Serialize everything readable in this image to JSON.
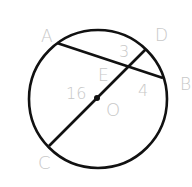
{
  "diagram": {
    "type": "circle-geometry",
    "circle": {
      "center_label": "O",
      "cx": 98,
      "cy": 99,
      "r": 69
    },
    "points": {
      "A": {
        "label": "A",
        "x": 57,
        "y": 43,
        "lx": 41,
        "ly": 42
      },
      "B": {
        "label": "B",
        "x": 163,
        "y": 78,
        "lx": 180,
        "ly": 90
      },
      "C": {
        "label": "C",
        "x": 49,
        "y": 146,
        "lx": 38,
        "ly": 169
      },
      "D": {
        "label": "D",
        "x": 146,
        "y": 49,
        "lx": 155,
        "ly": 41
      },
      "E": {
        "label": "E",
        "x": 128,
        "y": 67,
        "lx": 98,
        "ly": 81
      },
      "O": {
        "label": "O",
        "x": 97,
        "y": 98,
        "lx": 106,
        "ly": 116
      }
    },
    "segment_labels": {
      "DE": {
        "text": "3",
        "x": 119,
        "y": 57
      },
      "EB": {
        "text": "4",
        "x": 138,
        "y": 96
      },
      "OC_radius": {
        "text": "16",
        "x": 66,
        "y": 99
      }
    },
    "chords": [
      {
        "name": "AB",
        "from": "A",
        "to": "B"
      },
      {
        "name": "CD",
        "from": "C",
        "to": "D"
      }
    ],
    "colors": {
      "stroke": "#111111",
      "label": "#c8c8c8",
      "background": "#ffffff"
    }
  }
}
